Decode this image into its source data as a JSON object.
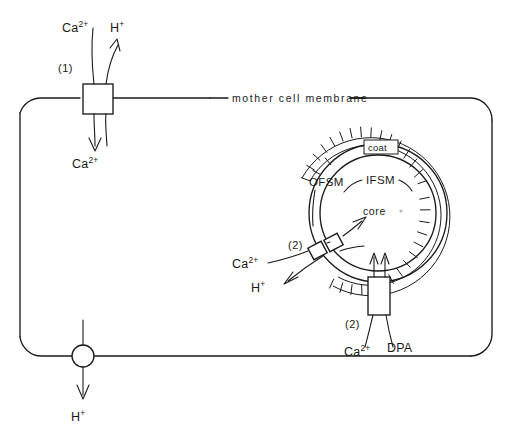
{
  "figure": {
    "background_color": "#ffffff",
    "ink_color": "#1a1a1a"
  },
  "mother_cell": {
    "membrane_label": "mother cell membrane"
  },
  "transporter_1": {
    "number_label": "(1)",
    "out_ion_ca": "Ca",
    "out_ion_ca_sup": "2+",
    "out_ion_h": "H",
    "out_ion_h_sup": "+",
    "in_ion_ca": "Ca",
    "in_ion_ca_sup": "2+"
  },
  "proton_pump": {
    "ion": "H",
    "ion_sup": "+"
  },
  "forespore": {
    "coat_label": "coat",
    "ofsm_label": "OFSM",
    "ifsm_label": "IFSM",
    "core_label": "core"
  },
  "transporter_2_antiport": {
    "number_label": "(2)",
    "in_ion_ca": "Ca",
    "in_ion_ca_sup": "2+",
    "out_ion_h": "H",
    "out_ion_h_sup": "+"
  },
  "transporter_2_dpa": {
    "number_label": "(2)",
    "in_ion_ca": "Ca",
    "in_ion_ca_sup": "2+",
    "in_dpa": "DPA"
  }
}
